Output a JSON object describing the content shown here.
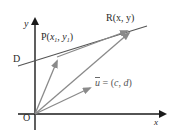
{
  "diagram": {
    "axes": {
      "x_label": "x",
      "y_label": "y",
      "origin_label": "O"
    },
    "line": {
      "label": "D"
    },
    "points": {
      "P": {
        "name": "P",
        "x_sub": "1",
        "y_sub": "1",
        "x_var": "x",
        "y_var": "y"
      },
      "R": {
        "text": "R(x, y)"
      }
    },
    "vector_u": {
      "name": "u",
      "equals_text": " = (",
      "c": "c",
      "comma": ", ",
      "d": "d",
      "close": ")"
    },
    "colors": {
      "axis": "#1a1a1a",
      "line_D": "#555555",
      "vectors": "#8a8a8a",
      "text": "#2a2a2a"
    }
  }
}
